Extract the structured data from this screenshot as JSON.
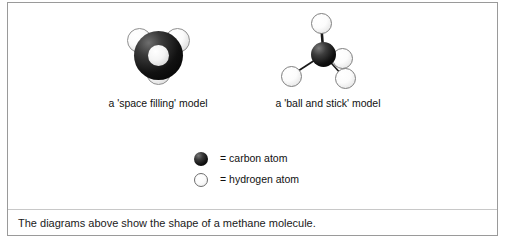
{
  "panel": {
    "caption": "The diagrams above show the shape of a methane molecule."
  },
  "models": [
    {
      "id": "space-filling",
      "caption": "a 'space filling' model",
      "atoms": {
        "carbon": 1,
        "hydrogen": 3
      }
    },
    {
      "id": "ball-and-stick",
      "caption": "a 'ball and stick' model",
      "atoms": {
        "carbon": 1,
        "hydrogen": 4
      }
    }
  ],
  "legend": {
    "items": [
      {
        "swatch": "filled-dark-circle",
        "label": "= carbon atom",
        "color": "#111111"
      },
      {
        "swatch": "outlined-light-circle",
        "label": "= hydrogen atom",
        "color": "#ffffff"
      }
    ]
  },
  "colors": {
    "carbon": "#111111",
    "hydrogen": "#f2f2f2",
    "bond": "#222222",
    "border": "#9a9a9a",
    "divider": "#c8c8c8",
    "background": "#ffffff"
  }
}
